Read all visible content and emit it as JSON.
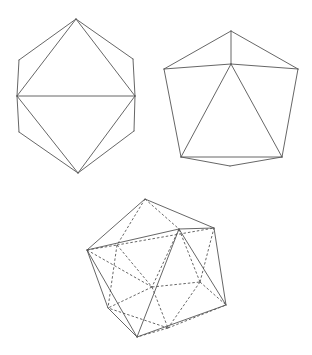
{
  "figure": {
    "line_color": "#555555",
    "background": "#ffffff"
  },
  "shapes": [
    {
      "name": "octahedron-projection",
      "vertices": {
        "top": [
          76,
          19
        ],
        "upper_left": [
          19,
          60
        ],
        "left": [
          17,
          96
        ],
        "lower_left": [
          19,
          132
        ],
        "bottom": [
          78,
          173
        ],
        "lower_right": [
          134,
          131
        ],
        "right": [
          135,
          96
        ],
        "upper_right": [
          133,
          59
        ]
      },
      "solid_edges": [
        [
          "top",
          "upper_left"
        ],
        [
          "upper_left",
          "left"
        ],
        [
          "left",
          "lower_left"
        ],
        [
          "lower_left",
          "bottom"
        ],
        [
          "bottom",
          "lower_right"
        ],
        [
          "lower_right",
          "right"
        ],
        [
          "right",
          "upper_right"
        ],
        [
          "upper_right",
          "top"
        ],
        [
          "top",
          "left"
        ],
        [
          "top",
          "right"
        ],
        [
          "left",
          "right"
        ],
        [
          "left",
          "bottom"
        ],
        [
          "right",
          "bottom"
        ]
      ],
      "dashed_edges": []
    },
    {
      "name": "pentagonal-pyramid-projection",
      "vertices": {
        "top": [
          231,
          31
        ],
        "left": [
          164,
          69
        ],
        "center": [
          231,
          64
        ],
        "right": [
          298,
          69
        ],
        "lower_left": [
          181,
          157
        ],
        "lower_right": [
          282,
          157
        ],
        "bottom": [
          230,
          166
        ]
      },
      "solid_edges": [
        [
          "top",
          "left"
        ],
        [
          "top",
          "right"
        ],
        [
          "top",
          "center"
        ],
        [
          "left",
          "center"
        ],
        [
          "center",
          "right"
        ],
        [
          "left",
          "lower_left"
        ],
        [
          "right",
          "lower_right"
        ],
        [
          "lower_left",
          "lower_right"
        ],
        [
          "lower_left",
          "bottom"
        ],
        [
          "bottom",
          "lower_right"
        ],
        [
          "center",
          "lower_left"
        ],
        [
          "center",
          "lower_right"
        ]
      ],
      "dashed_edges": []
    },
    {
      "name": "icosahedron-projection",
      "vertices": {
        "T": [
          145,
          199
        ],
        "UR": [
          214,
          228
        ],
        "F": [
          179,
          229
        ],
        "L": [
          87,
          250
        ],
        "BL": [
          117,
          245
        ],
        "RL": [
          226,
          305
        ],
        "B": [
          137,
          337
        ],
        "LL": [
          108,
          308
        ],
        "BC": [
          152,
          287
        ],
        "BR": [
          200,
          282
        ],
        "BM": [
          168,
          328
        ]
      },
      "solid_edges": [
        [
          "T",
          "L"
        ],
        [
          "T",
          "UR"
        ],
        [
          "L",
          "F"
        ],
        [
          "F",
          "UR"
        ],
        [
          "UR",
          "RL"
        ],
        [
          "F",
          "RL"
        ],
        [
          "F",
          "B"
        ],
        [
          "L",
          "LL"
        ],
        [
          "LL",
          "B"
        ],
        [
          "L",
          "B"
        ],
        [
          "B",
          "RL"
        ]
      ],
      "dashed_edges": [
        [
          "T",
          "BL"
        ],
        [
          "T",
          "F"
        ],
        [
          "BL",
          "UR"
        ],
        [
          "L",
          "BL"
        ],
        [
          "BL",
          "BC"
        ],
        [
          "BL",
          "LL"
        ],
        [
          "L",
          "BC"
        ],
        [
          "BC",
          "BR"
        ],
        [
          "BC",
          "LL"
        ],
        [
          "BC",
          "BM"
        ],
        [
          "BR",
          "UR"
        ],
        [
          "BR",
          "RL"
        ],
        [
          "BR",
          "BM"
        ],
        [
          "BR",
          "F"
        ],
        [
          "BM",
          "LL"
        ],
        [
          "BM",
          "B"
        ],
        [
          "BM",
          "RL"
        ],
        [
          "F",
          "BC"
        ]
      ]
    }
  ]
}
